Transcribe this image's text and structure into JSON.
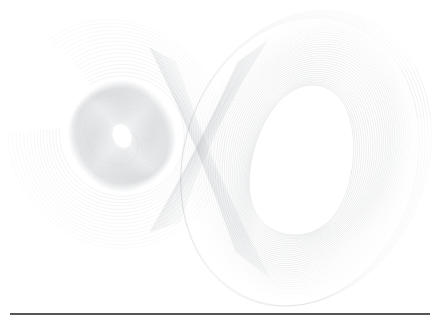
{
  "figure": {
    "title": "Lorenz Attractor",
    "background_color": "#ffffff",
    "width": 439,
    "height": 323
  },
  "rules": {
    "top_label": "top-rule",
    "bottom_label": "bottom-rule",
    "color": "#56565a",
    "thickness": 2,
    "x_start": 10,
    "x_end": 430,
    "y_top": 3,
    "y_bottom": 314
  },
  "chart_data": {
    "type": "line",
    "title": "Lorenz Attractor",
    "subtitle": "",
    "xlabel": "",
    "ylabel": "",
    "grid": false,
    "legend": "none",
    "axes_visible": false,
    "tick_labels_x": [],
    "tick_labels_y": [],
    "xlim": [
      -22,
      22
    ],
    "ylim": [
      -32,
      32
    ],
    "projection": "x-z plane",
    "system": "Lorenz",
    "parameters": {
      "sigma": 10,
      "rho": 28,
      "beta": 2.6667
    },
    "line_color": "#9aa0a6",
    "line_width": 0.35,
    "series": [
      {
        "name": "trajectory",
        "description": "single chaotic orbit, two-lobed butterfly",
        "left_lobe": {
          "center_x": 122,
          "center_y": 136,
          "rx_outer": 52,
          "ry_outer": 56,
          "rx_inner": 9,
          "ry_inner": 12,
          "tilt_deg": -22,
          "orbit_count": 95,
          "density": "dense"
        },
        "right_lobe": {
          "center_x": 303,
          "center_y": 160,
          "rx_outer": 112,
          "ry_outer": 143,
          "rx_inner": 50,
          "ry_inner": 78,
          "tilt_deg": 14,
          "orbit_count": 34,
          "density": "sparse"
        },
        "crossing_x": 214,
        "crossing_y": 140
      }
    ],
    "annotations": []
  },
  "elements": {
    "plot_area_name": "attractor-plot-area",
    "left_lobe_name": "left-lobe-spiral",
    "right_lobe_name": "right-lobe-spiral",
    "crossing_name": "lobe-crossing-band"
  }
}
